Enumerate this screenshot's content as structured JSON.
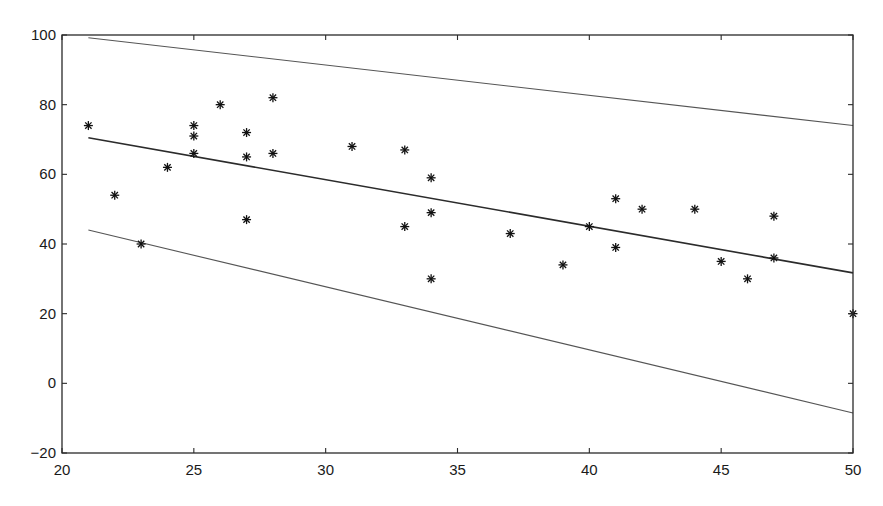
{
  "chart_data": {
    "type": "scatter",
    "title": "",
    "xlabel": "",
    "ylabel": "",
    "xlim": [
      20,
      50
    ],
    "ylim": [
      -20,
      100
    ],
    "grid": false,
    "legend": null,
    "x_ticks": [
      20,
      25,
      30,
      35,
      40,
      45,
      50
    ],
    "y_ticks": [
      100,
      80,
      60,
      40,
      20,
      0,
      -20
    ],
    "x_tick_labels": [
      "20",
      "25",
      "30",
      "35",
      "40",
      "45",
      "50"
    ],
    "y_tick_labels": [
      "100",
      "80",
      "60",
      "40",
      "20",
      "0",
      "−20"
    ],
    "series": [
      {
        "name": "observations",
        "kind": "scatter",
        "marker": "asterisk",
        "points": [
          [
            21,
            74
          ],
          [
            22,
            54
          ],
          [
            23,
            40
          ],
          [
            24,
            62
          ],
          [
            25,
            74
          ],
          [
            25,
            71
          ],
          [
            25,
            66
          ],
          [
            26,
            80
          ],
          [
            27,
            72
          ],
          [
            27,
            65
          ],
          [
            27,
            47
          ],
          [
            28,
            82
          ],
          [
            28,
            66
          ],
          [
            31,
            68
          ],
          [
            33,
            67
          ],
          [
            33,
            45
          ],
          [
            34,
            59
          ],
          [
            34,
            49
          ],
          [
            34,
            30
          ],
          [
            37,
            43
          ],
          [
            39,
            34
          ],
          [
            40,
            45
          ],
          [
            41,
            53
          ],
          [
            41,
            39
          ],
          [
            42,
            50
          ],
          [
            44,
            50
          ],
          [
            45,
            35
          ],
          [
            46,
            30
          ],
          [
            47,
            48
          ],
          [
            47,
            36
          ],
          [
            50,
            20
          ]
        ]
      },
      {
        "name": "regression line",
        "kind": "line",
        "style": "fit",
        "points": [
          [
            21,
            70.5
          ],
          [
            50,
            31.7
          ]
        ]
      },
      {
        "name": "upper band",
        "kind": "line",
        "style": "band",
        "points": [
          [
            21,
            99.2
          ],
          [
            50,
            74
          ]
        ]
      },
      {
        "name": "lower band",
        "kind": "line",
        "style": "band",
        "points": [
          [
            21,
            44
          ],
          [
            50,
            -8.5
          ]
        ]
      }
    ],
    "layout": {
      "plot_left": 62,
      "plot_right": 853,
      "plot_top": 35,
      "plot_bottom": 453
    }
  }
}
